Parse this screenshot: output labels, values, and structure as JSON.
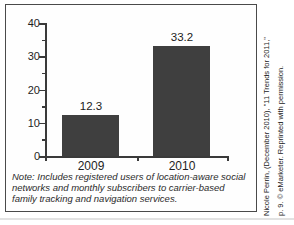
{
  "chart_data": {
    "type": "bar",
    "categories": [
      "2009",
      "2010"
    ],
    "values": [
      12.3,
      33.2
    ],
    "value_labels": [
      "12.3",
      "33.2"
    ],
    "title": "",
    "xlabel": "",
    "ylabel": "",
    "ylim": [
      0,
      40
    ],
    "yticks": [
      0,
      10,
      20,
      30,
      40
    ],
    "minor_ytick_interval": 5,
    "grid": false,
    "legend": "none",
    "bar_color": "#3f3f3f"
  },
  "note": "Note: Includes registered users of location-aware social networks and monthly subscribers to carrier-based family tracking and navigation services.",
  "citation": {
    "line1": "Nicole Perrin, (December 2010), \"11 Trends for 2011,\"",
    "line2": "p. 9. © eMarketer. Reprinted with permission."
  },
  "colors": {
    "bar": "#3f3f3f",
    "axis": "#3a3a3a",
    "border": "#4a4a4a",
    "text": "#2e2e2e"
  }
}
